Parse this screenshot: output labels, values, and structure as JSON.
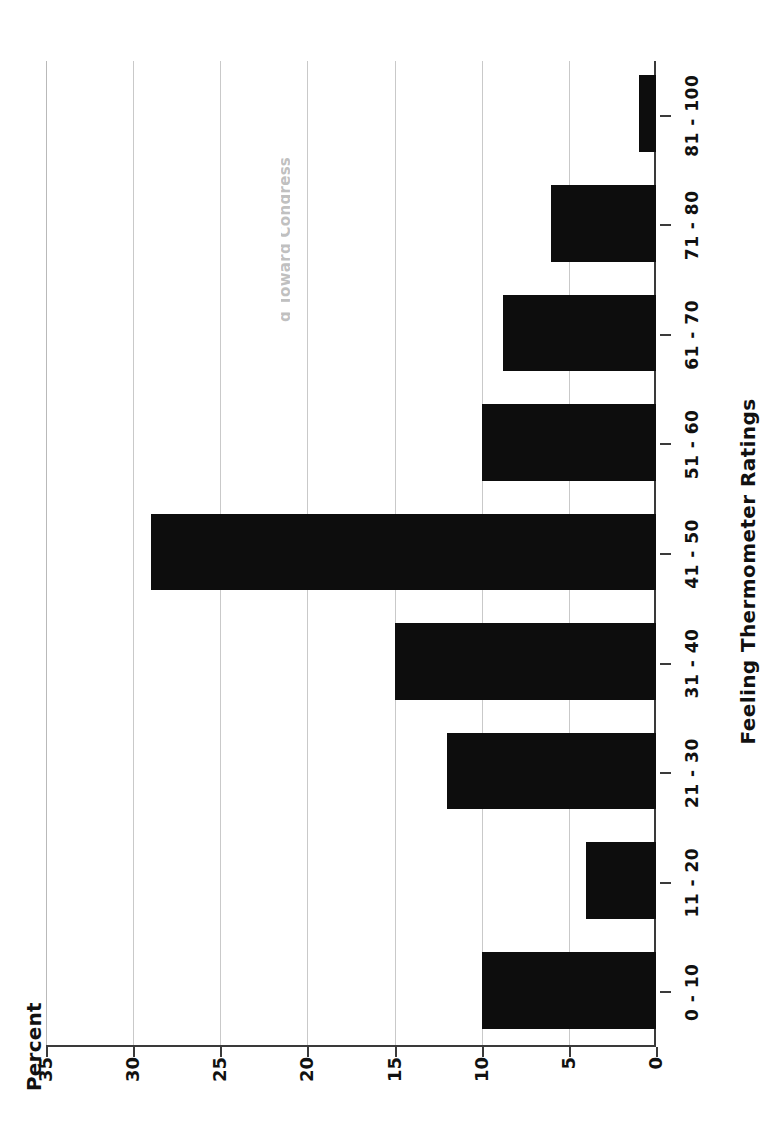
{
  "figure": {
    "clipped_title": "g Toward Congress",
    "y_axis_label": "Percent",
    "x_axis_label": "Feeling Thermometer Ratings",
    "bar_color": "#0d0d0d",
    "grid_color": "#c9c9c9",
    "axis_color": "#3a3a3a"
  },
  "chart_data": {
    "type": "bar",
    "orientation": "vertical",
    "title": "g Toward Congress",
    "xlabel": "Feeling Thermometer Ratings",
    "ylabel": "Percent",
    "categories": [
      "0 - 10",
      "11 - 20",
      "21 - 30",
      "31 - 40",
      "41 - 50",
      "51 - 60",
      "61 - 70",
      "71 - 80",
      "81 - 100"
    ],
    "values": [
      10,
      4,
      12,
      15,
      29,
      10,
      8.8,
      6,
      1
    ],
    "ylim": [
      0,
      35
    ],
    "yticks": [
      0,
      5,
      10,
      15,
      20,
      25,
      30,
      35
    ],
    "ytick_labels": [
      "0",
      "5",
      "10",
      "15",
      "20",
      "25",
      "30",
      "35"
    ],
    "grid": true,
    "grid_axis": "y",
    "legend": false
  }
}
